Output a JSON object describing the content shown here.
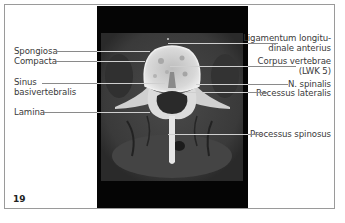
{
  "figure": {
    "number": "19",
    "image_description": "Axial CT image of lumbar vertebra",
    "labels_left": [
      {
        "id": "spongiosa",
        "text": "Spongiosa"
      },
      {
        "id": "compacta",
        "text": "Compacta"
      },
      {
        "id": "sinus_line1",
        "text": "Sinus"
      },
      {
        "id": "sinus_line2",
        "text": "basivertebralis"
      },
      {
        "id": "lamina",
        "text": "Lamina"
      }
    ],
    "labels_right": [
      {
        "id": "ligamentum_line1",
        "text": "Ligamentum longitu-"
      },
      {
        "id": "ligamentum_line2",
        "text": "dinale anterius"
      },
      {
        "id": "corpus_line1",
        "text": "Corpus vertebrae"
      },
      {
        "id": "corpus_line2",
        "text": "(LWK 5)"
      },
      {
        "id": "n_spinalis",
        "text": "N. spinalis"
      },
      {
        "id": "recessus",
        "text": "Recessus lateralis"
      },
      {
        "id": "processus",
        "text": "Processus spinosus"
      }
    ]
  }
}
